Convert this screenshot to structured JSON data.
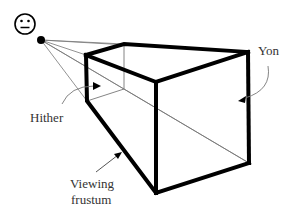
{
  "diagram": {
    "colors": {
      "background": "#ffffff",
      "thick_line": "#000000",
      "thin_line": "#777777",
      "label_text": "#333333"
    },
    "eye": {
      "icon": "neutral-face-icon",
      "cx": 41,
      "cy": 40
    },
    "labels": {
      "yon": "Yon",
      "hither": "Hither",
      "frustum_line1": "Viewing",
      "frustum_line2": "frustum"
    },
    "vertices": {
      "near_top_left": [
        86,
        55
      ],
      "near_top_right": [
        124,
        44
      ],
      "near_bottom_right": [
        124,
        89
      ],
      "near_bottom_left": [
        87,
        101
      ],
      "far_top_left": [
        156,
        82
      ],
      "far_top_right": [
        248,
        52
      ],
      "far_bottom_right": [
        249,
        163
      ],
      "far_bottom_left": [
        156,
        193
      ]
    }
  }
}
